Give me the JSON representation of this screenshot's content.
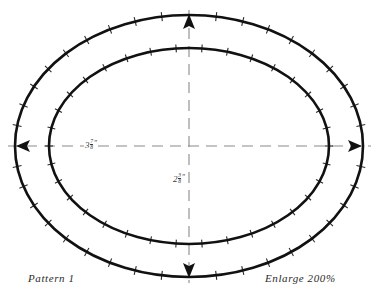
{
  "page": {
    "background_color": "#ffffff",
    "width": 385,
    "height": 300
  },
  "captions": {
    "left": "Pattern 1",
    "right": "Enlarge 200%"
  },
  "dimensions": {
    "horizontal": {
      "whole": "3",
      "numerator": "7",
      "denominator": "8",
      "unit": "″",
      "full_text": "3 7/8″"
    },
    "vertical": {
      "whole": "2",
      "numerator": "3",
      "denominator": "8",
      "unit": "″",
      "full_text": "2 3/8″"
    }
  },
  "colors": {
    "stroke": "#111111",
    "tick": "#2a2a2a",
    "centerline": "#8a8a8a",
    "text": "#2b2b2b"
  },
  "geometry": {
    "center": {
      "x": 189,
      "y": 146
    },
    "outer_oval": {
      "rx": 174,
      "ry": 131,
      "tick_count": 40,
      "tick_length": 9
    },
    "inner_oval": {
      "rx": 140,
      "ry": 98,
      "tick_count": 34,
      "tick_length": 8
    },
    "centerlines": {
      "horizontal": {
        "x1": 8,
        "x2": 371,
        "y": 146,
        "dash": "11 7"
      },
      "vertical": {
        "y1": 10,
        "y2": 283,
        "x": 189,
        "dash": "11 7"
      }
    },
    "arrows": [
      "left",
      "right",
      "up",
      "down"
    ]
  }
}
